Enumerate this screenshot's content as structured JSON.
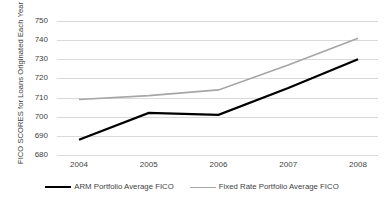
{
  "chart_data": {
    "type": "line",
    "title": "",
    "xlabel": "",
    "ylabel": "FICO SCORES for Loans Originated Each Year",
    "categories": [
      "2004",
      "2005",
      "2006",
      "2007",
      "2008"
    ],
    "ylim": [
      675,
      753
    ],
    "yticks": [
      680,
      690,
      700,
      710,
      720,
      730,
      740,
      750
    ],
    "ytick_labels": [
      "680",
      "690",
      "700",
      "710",
      "720",
      "730",
      "740",
      "750"
    ],
    "grid": true,
    "legend_position": "bottom",
    "series": [
      {
        "name": "ARM Portfolio Average FICO",
        "color": "#000000",
        "width": 2.2,
        "values": [
          688,
          702,
          701,
          715,
          730
        ]
      },
      {
        "name": "Fixed Rate Portfolio Average FICO",
        "color": "#a6a6a6",
        "width": 1.6,
        "values": [
          709,
          711,
          714,
          727,
          741
        ]
      }
    ]
  },
  "colors": {
    "grid": "#d9d9d9",
    "text": "#3f3f3f",
    "background": "#ffffff",
    "series_arm": "#000000",
    "series_fixed": "#a6a6a6"
  }
}
